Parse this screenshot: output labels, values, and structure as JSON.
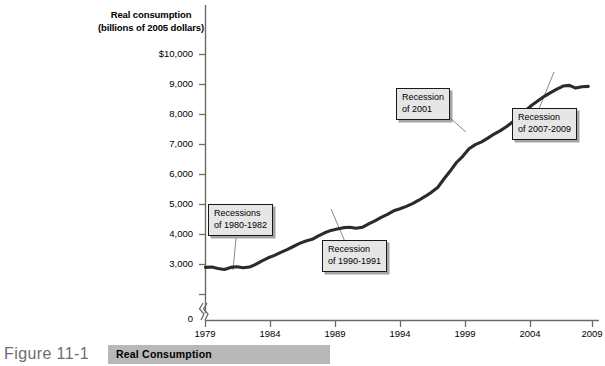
{
  "figure": {
    "number": "Figure 11-1",
    "caption": "Real Consumption"
  },
  "axis_title_line1": "Real consumption",
  "axis_title_line2": "(billions of 2005 dollars)",
  "yticks": [
    "$10,000",
    "9,000",
    "8,000",
    "7,000",
    "6,000",
    "5,000",
    "4,000",
    "3,000",
    "0"
  ],
  "xticks": [
    "1979",
    "1984",
    "1989",
    "1994",
    "1999",
    "2004",
    "2009"
  ],
  "annotations": [
    {
      "line1": "Recessions",
      "line2": "of 1980-1982"
    },
    {
      "line1": "Recession",
      "line2": "of 1990-1991"
    },
    {
      "line1": "Recession",
      "line2": "of 2001"
    },
    {
      "line1": "Recession",
      "line2": "of 2007-2009"
    }
  ],
  "colors": {
    "line": "#2b2b2b",
    "axis": "#6b6b6b",
    "callout_fill": "#e6e6e6",
    "callout_border": "#1a1a1a",
    "band": "#b8b8b8",
    "fig_label": "#6e6e6e"
  },
  "chart_data": {
    "type": "line",
    "title": "Real Consumption",
    "xlabel": "",
    "ylabel": "Real consumption (billions of 2005 dollars)",
    "xlim": [
      1979,
      2009.8
    ],
    "ylim": [
      3000,
      10000
    ],
    "y_axis_break": true,
    "y_axis_break_below": 3000,
    "grid": false,
    "legend": null,
    "ytick_values": [
      10000,
      9000,
      8000,
      7000,
      6000,
      5000,
      4000,
      3000,
      0
    ],
    "xtick_values": [
      1979,
      1984,
      1989,
      1994,
      1999,
      2004,
      2009
    ],
    "x": [
      1979.0,
      1979.5,
      1980.0,
      1980.5,
      1981.0,
      1981.5,
      1982.0,
      1982.5,
      1983.0,
      1983.5,
      1984.0,
      1984.5,
      1985.0,
      1985.5,
      1986.0,
      1986.5,
      1987.0,
      1987.5,
      1988.0,
      1988.5,
      1989.0,
      1989.5,
      1990.0,
      1990.5,
      1991.0,
      1991.5,
      1992.0,
      1992.5,
      1993.0,
      1993.5,
      1994.0,
      1994.5,
      1995.0,
      1995.5,
      1996.0,
      1996.5,
      1997.0,
      1997.5,
      1998.0,
      1998.5,
      1999.0,
      1999.5,
      2000.0,
      2000.5,
      2001.0,
      2001.5,
      2002.0,
      2002.5,
      2003.0,
      2003.5,
      2004.0,
      2004.5,
      2005.0,
      2005.5,
      2006.0,
      2006.5,
      2007.0,
      2007.5,
      2008.0,
      2008.5,
      2009.0,
      2009.5
    ],
    "y": [
      3790,
      3800,
      3760,
      3730,
      3790,
      3810,
      3780,
      3800,
      3880,
      3980,
      4070,
      4140,
      4230,
      4310,
      4400,
      4490,
      4560,
      4610,
      4710,
      4800,
      4870,
      4910,
      4950,
      4960,
      4930,
      4960,
      5060,
      5150,
      5250,
      5340,
      5440,
      5500,
      5570,
      5650,
      5750,
      5860,
      5980,
      6120,
      6370,
      6600,
      6850,
      7030,
      7250,
      7370,
      7450,
      7560,
      7680,
      7780,
      7900,
      8040,
      8210,
      8360,
      8520,
      8650,
      8780,
      8890,
      8990,
      9080,
      9100,
      9020,
      9060,
      9070
    ],
    "annotations": [
      {
        "text": "Recessions of 1980-1982",
        "points_to_x": 1981.2,
        "points_to_y": 3800
      },
      {
        "text": "Recession of 1990-1991",
        "points_to_x": 1990.7,
        "points_to_y": 4950
      },
      {
        "text": "Recession of 2001",
        "points_to_x": 2001.3,
        "points_to_y": 7500
      },
      {
        "text": "Recession of 2007-2009",
        "points_to_x": 2008.0,
        "points_to_y": 9090
      }
    ]
  }
}
